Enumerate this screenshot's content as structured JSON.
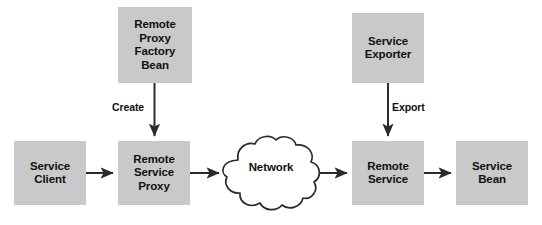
{
  "diagram": {
    "background_color": "#ffffff",
    "node_fill_color": "#c9c9c9",
    "line_color": "#2b2b2b",
    "text_color": "#111111",
    "nodes": [
      {
        "id": "remote-proxy-factory-bean",
        "label": "Remote\nProxy\nFactory\nBean",
        "shape": "rectangle",
        "x": 118,
        "y": 7,
        "width": 74,
        "height": 76
      },
      {
        "id": "service-exporter",
        "label": "Service\nExporter",
        "shape": "rectangle",
        "x": 352,
        "y": 13,
        "width": 72,
        "height": 70
      },
      {
        "id": "service-client",
        "label": "Service\nClient",
        "shape": "rectangle",
        "x": 14,
        "y": 141,
        "width": 72,
        "height": 64
      },
      {
        "id": "remote-service-proxy",
        "label": "Remote\nService\nProxy",
        "shape": "rectangle",
        "x": 118,
        "y": 141,
        "width": 72,
        "height": 64
      },
      {
        "id": "network",
        "label": "Network",
        "shape": "cloud",
        "x": 220,
        "y": 134,
        "width": 104,
        "height": 78
      },
      {
        "id": "remote-service",
        "label": "Remote\nService",
        "shape": "rectangle",
        "x": 352,
        "y": 141,
        "width": 72,
        "height": 64
      },
      {
        "id": "service-bean",
        "label": "Service\nBean",
        "shape": "rectangle",
        "x": 456,
        "y": 141,
        "width": 72,
        "height": 64
      }
    ],
    "edges": [
      {
        "id": "create-edge",
        "from": "remote-proxy-factory-bean",
        "to": "remote-service-proxy",
        "label": "Create",
        "direction": "down",
        "label_x": 112,
        "label_y": 101
      },
      {
        "id": "export-edge",
        "from": "service-exporter",
        "to": "remote-service",
        "label": "Export",
        "direction": "down",
        "label_x": 392,
        "label_y": 101
      },
      {
        "id": "client-to-proxy-edge",
        "from": "service-client",
        "to": "remote-service-proxy",
        "label": "",
        "direction": "right"
      },
      {
        "id": "proxy-to-network-edge",
        "from": "remote-service-proxy",
        "to": "network",
        "label": "",
        "direction": "right"
      },
      {
        "id": "network-to-remote-service-edge",
        "from": "network",
        "to": "remote-service",
        "label": "",
        "direction": "right"
      },
      {
        "id": "remote-service-to-bean-edge",
        "from": "remote-service",
        "to": "service-bean",
        "label": "",
        "direction": "right"
      }
    ]
  }
}
